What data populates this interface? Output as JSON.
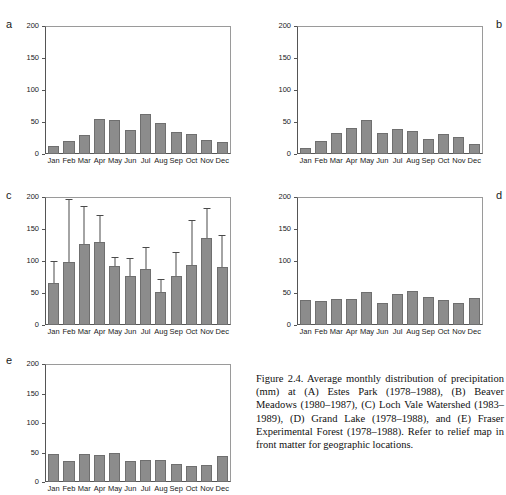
{
  "figure": {
    "number": "Figure 2.4.",
    "caption": "Figure 2.4. Average monthly distribution of precipitation (mm) at (A) Estes Park (1978–1988), (B) Beaver Meadows (1980–1987), (C) Loch Vale Watershed (1983–1989), (D) Grand Lake (1978–1988), and (E) Fraser Experimental Forest (1978–1988). Refer to relief map in front matter for geographic locations.",
    "bar_color": "#8c8c8c",
    "axis_color": "#555555"
  },
  "axis": {
    "ylim": [
      0,
      200
    ],
    "yticks": [
      "0",
      "50",
      "100",
      "150",
      "200"
    ],
    "ytick_values": [
      0,
      50,
      100,
      150,
      200
    ],
    "categories": [
      "Jan",
      "Feb",
      "Mar",
      "Apr",
      "May",
      "Jun",
      "Jul",
      "Aug",
      "Sep",
      "Oct",
      "Nov",
      "Dec"
    ]
  },
  "panels": [
    {
      "label": "a",
      "label_pos": "left",
      "site": "Estes Park",
      "period": "1978–1988"
    },
    {
      "label": "b",
      "label_pos": "right",
      "site": "Beaver Meadows",
      "period": "1980–1987"
    },
    {
      "label": "c",
      "label_pos": "left",
      "site": "Loch Vale Watershed",
      "period": "1983–1989"
    },
    {
      "label": "d",
      "label_pos": "right",
      "site": "Grand Lake",
      "period": "1978–1988"
    },
    {
      "label": "e",
      "label_pos": "left",
      "site": "Fraser Experimental Forest",
      "period": "1978–1988"
    }
  ],
  "chart_data": [
    {
      "type": "bar",
      "panel": "a",
      "title": "Estes Park (1978–1988)",
      "xlabel": "",
      "ylabel": "",
      "ylim": [
        0,
        200
      ],
      "grid": false,
      "categories": [
        "Jan",
        "Feb",
        "Mar",
        "Apr",
        "May",
        "Jun",
        "Jul",
        "Aug",
        "Sep",
        "Oct",
        "Nov",
        "Dec"
      ],
      "values": [
        13,
        20,
        30,
        54,
        53,
        38,
        63,
        49,
        34,
        31,
        22,
        18
      ]
    },
    {
      "type": "bar",
      "panel": "b",
      "title": "Beaver Meadows (1980–1987)",
      "xlabel": "",
      "ylabel": "",
      "ylim": [
        0,
        200
      ],
      "grid": false,
      "categories": [
        "Jan",
        "Feb",
        "Mar",
        "Apr",
        "May",
        "Jun",
        "Jul",
        "Aug",
        "Sep",
        "Oct",
        "Nov",
        "Dec"
      ],
      "values": [
        9,
        20,
        33,
        40,
        53,
        33,
        39,
        36,
        24,
        31,
        27,
        16
      ]
    },
    {
      "type": "bar",
      "panel": "c",
      "title": "Loch Vale Watershed (1983–1989)",
      "xlabel": "",
      "ylabel": "",
      "ylim": [
        0,
        200
      ],
      "grid": false,
      "categories": [
        "Jan",
        "Feb",
        "Mar",
        "Apr",
        "May",
        "Jun",
        "Jul",
        "Aug",
        "Sep",
        "Oct",
        "Nov",
        "Dec"
      ],
      "values": [
        66,
        99,
        126,
        129,
        92,
        77,
        87,
        52,
        77,
        94,
        136,
        90
      ],
      "error_high": [
        98,
        195,
        184,
        171,
        104,
        103,
        121,
        70,
        113,
        163,
        181,
        139
      ]
    },
    {
      "type": "bar",
      "panel": "d",
      "title": "Grand Lake (1978–1988)",
      "xlabel": "",
      "ylabel": "",
      "ylim": [
        0,
        200
      ],
      "grid": false,
      "categories": [
        "Jan",
        "Feb",
        "Mar",
        "Apr",
        "May",
        "Jun",
        "Jul",
        "Aug",
        "Sep",
        "Oct",
        "Nov",
        "Dec"
      ],
      "values": [
        39,
        37,
        41,
        40,
        51,
        35,
        48,
        53,
        44,
        39,
        35,
        42
      ]
    },
    {
      "type": "bar",
      "panel": "e",
      "title": "Fraser Experimental Forest (1978–1988)",
      "xlabel": "",
      "ylabel": "",
      "ylim": [
        0,
        200
      ],
      "grid": false,
      "categories": [
        "Jan",
        "Feb",
        "Mar",
        "Apr",
        "May",
        "Jun",
        "Jul",
        "Aug",
        "Sep",
        "Oct",
        "Nov",
        "Dec"
      ],
      "values": [
        47,
        36,
        48,
        46,
        50,
        35,
        37,
        38,
        30,
        27,
        29,
        44
      ]
    }
  ]
}
